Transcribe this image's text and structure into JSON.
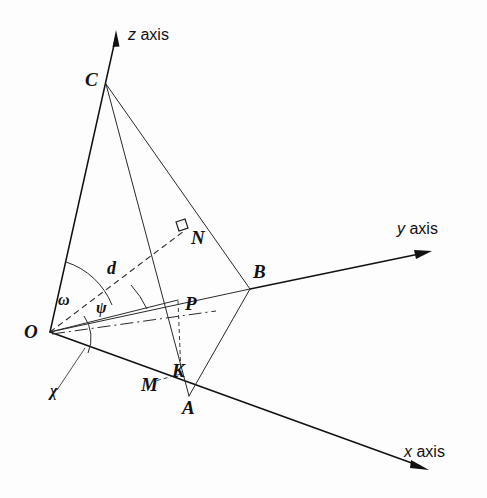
{
  "figure": {
    "type": "geometry-diagram",
    "background_color": "#fdfdfd",
    "stroke_color": "#1a1a1a"
  },
  "axes": [
    {
      "id": "z",
      "label_italic": "z",
      "label_rest": " axis",
      "full_label": "z axis"
    },
    {
      "id": "y",
      "label_italic": "y",
      "label_rest": " axis",
      "full_label": "y axis"
    },
    {
      "id": "x",
      "label_italic": "x",
      "label_rest": " axis",
      "full_label": "x axis"
    }
  ],
  "points": [
    {
      "id": "O",
      "label": "O"
    },
    {
      "id": "C",
      "label": "C"
    },
    {
      "id": "B",
      "label": "B"
    },
    {
      "id": "A",
      "label": "A"
    },
    {
      "id": "M",
      "label": "M"
    },
    {
      "id": "K",
      "label": "K"
    },
    {
      "id": "N",
      "label": "N"
    },
    {
      "id": "P",
      "label": "P"
    }
  ],
  "angles": [
    {
      "id": "omega",
      "label": "ω",
      "between": "OC and ON"
    },
    {
      "id": "psi",
      "label": "ψ",
      "between": "ON and OP"
    },
    {
      "id": "chi",
      "label": "χ",
      "between": "OP and OA"
    }
  ],
  "segments": [
    {
      "id": "d",
      "label": "d",
      "style": "dashed",
      "from": "O",
      "to": "N"
    }
  ],
  "markers": [
    {
      "id": "right-angle-N",
      "kind": "right-angle-square",
      "at": "N"
    }
  ]
}
